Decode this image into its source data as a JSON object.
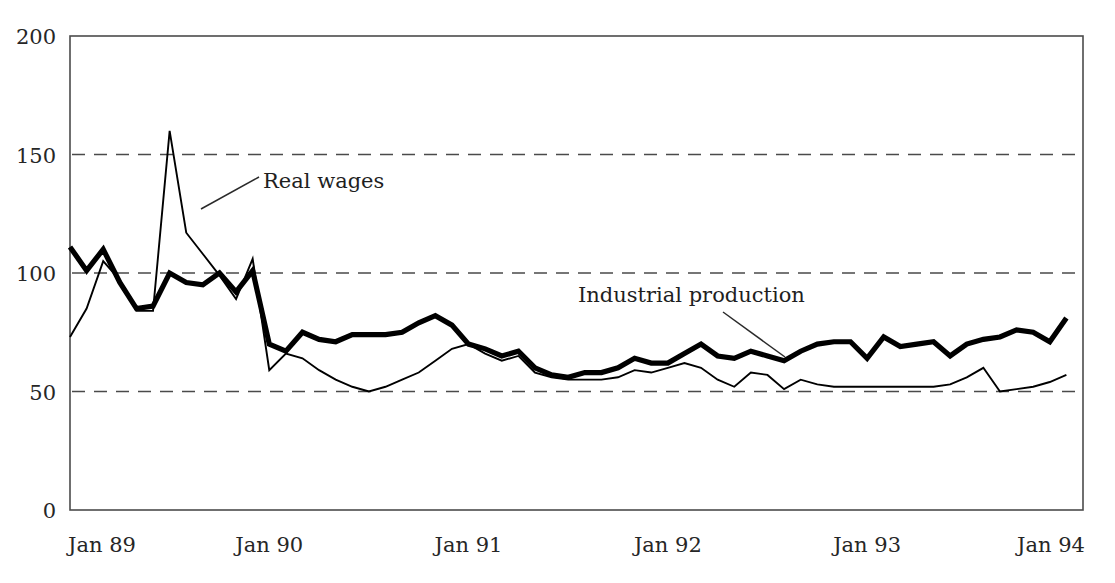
{
  "chart_data": {
    "type": "line",
    "title": "",
    "xlabel": "",
    "ylabel": "",
    "ylim": [
      0,
      200
    ],
    "yticks": [
      0,
      50,
      100,
      150,
      200
    ],
    "ytick_labels": [
      "0",
      "50",
      "100",
      "150",
      "200"
    ],
    "gridlines": [
      50,
      100,
      150
    ],
    "grid": "horizontal-dashed",
    "legend": "inline-annotations",
    "xticks": [
      0,
      12,
      24,
      36,
      48,
      60
    ],
    "xtick_labels": [
      "Jan 89",
      "Jan 90",
      "Jan 91",
      "Jan 92",
      "Jan 93",
      "Jan 94"
    ],
    "x_range": [
      0,
      61
    ],
    "annotations": [
      {
        "text": "Real wages",
        "series": "Real wages"
      },
      {
        "text": "Industrial production",
        "series": "Industrial production"
      }
    ],
    "series": [
      {
        "name": "Industrial production",
        "style": "thick",
        "values": [
          111,
          101,
          110,
          96,
          85,
          86,
          100,
          96,
          95,
          100,
          92,
          101,
          70,
          67,
          75,
          72,
          71,
          74,
          74,
          74,
          75,
          79,
          82,
          78,
          70,
          68,
          65,
          67,
          60,
          57,
          56,
          58,
          58,
          60,
          64,
          62,
          62,
          66,
          70,
          65,
          64,
          67,
          65,
          63,
          67,
          70,
          71,
          71,
          64,
          73,
          69,
          70,
          71,
          65,
          70,
          72,
          73,
          76,
          75,
          71,
          81
        ]
      },
      {
        "name": "Real wages",
        "style": "thin",
        "values": [
          73,
          85,
          105,
          97,
          84,
          84,
          160,
          117,
          108,
          99,
          89,
          106,
          59,
          66,
          64,
          59,
          55,
          52,
          50,
          52,
          55,
          58,
          63,
          68,
          70,
          66,
          63,
          65,
          58,
          56,
          55,
          55,
          55,
          56,
          59,
          58,
          60,
          62,
          60,
          55,
          52,
          58,
          57,
          51,
          55,
          53,
          52,
          52,
          52,
          52,
          52,
          52,
          52,
          53,
          56,
          60,
          50,
          51,
          52,
          54,
          57
        ]
      }
    ]
  },
  "axis": {
    "y_labels": [
      "200",
      "150",
      "100",
      "50",
      "0"
    ],
    "x_labels": [
      "Jan 89",
      "Jan 90",
      "Jan 91",
      "Jan 92",
      "Jan 93",
      "Jan 94"
    ]
  },
  "annotations": {
    "real_wages": "Real wages",
    "industrial_production": "Industrial production"
  }
}
